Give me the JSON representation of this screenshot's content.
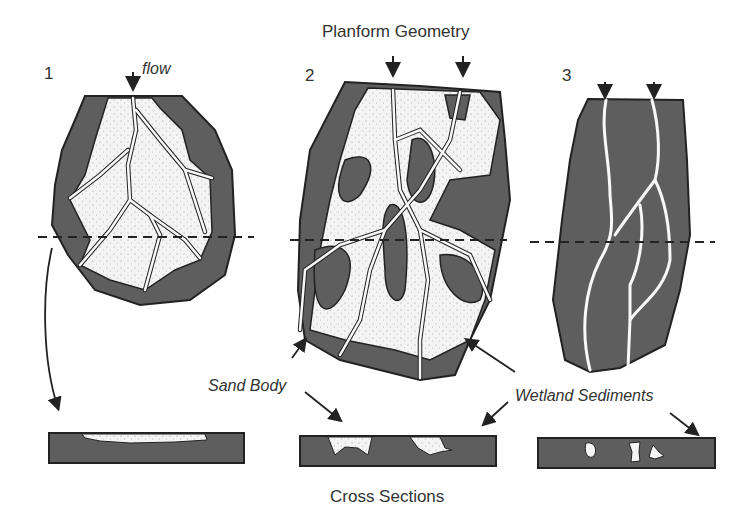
{
  "title_top": "Planform Geometry",
  "title_bottom": "Cross Sections",
  "panels": [
    {
      "number": "1",
      "flow_label": "flow"
    },
    {
      "number": "2"
    },
    {
      "number": "3"
    }
  ],
  "annotations": {
    "sand_body": "Sand Body",
    "wetland_sediments": "Wetland Sediments"
  },
  "colors": {
    "wetland": "#5e5e5e",
    "sand": "#f4f4f4",
    "outline": "#222222"
  }
}
